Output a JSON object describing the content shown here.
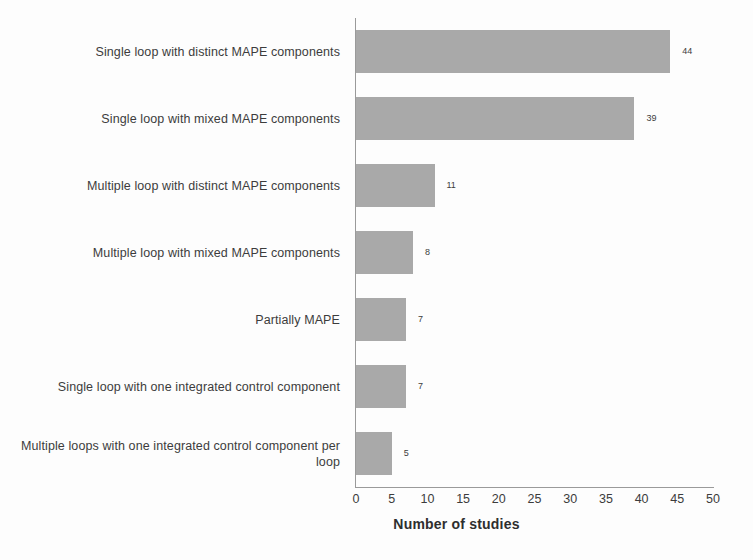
{
  "chart_data": {
    "type": "bar",
    "orientation": "horizontal",
    "title": "",
    "subtitle": "",
    "xlabel": "Number of studies",
    "ylabel": "",
    "xlim": [
      0,
      50
    ],
    "xticks": [
      0,
      5,
      10,
      15,
      20,
      25,
      30,
      35,
      40,
      45,
      50
    ],
    "xtick_labels": [
      "0",
      "5",
      "10",
      "15",
      "20",
      "25",
      "30",
      "35",
      "40",
      "45",
      "50"
    ],
    "grid": false,
    "legend": false,
    "legend_position": "none",
    "bar_color": "#a9a9a9",
    "text_color": "#3c3c3c",
    "background_color": "#fdfdfd",
    "categories": [
      "Single loop with distinct MAPE components",
      "Single loop with mixed MAPE components",
      "Multiple loop with distinct MAPE components",
      "Multiple loop with mixed MAPE components",
      "Partially MAPE",
      "Single loop with one integrated control component",
      "Multiple loops with one integrated control component per loop"
    ],
    "values": [
      44,
      39,
      11,
      8,
      7,
      7,
      5
    ],
    "data_labels": [
      "44",
      "39",
      "11",
      "8",
      "7",
      "7",
      "5"
    ]
  },
  "axis": {
    "x_title": "Number of studies"
  }
}
